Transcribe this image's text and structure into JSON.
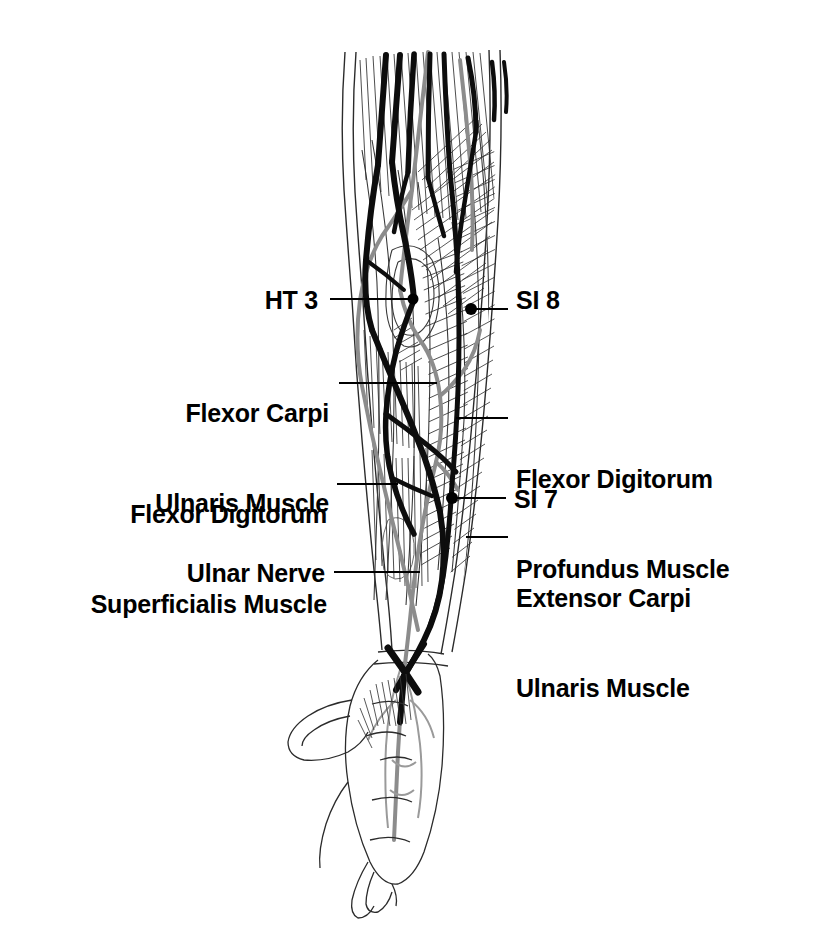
{
  "figure": {
    "view": "anterior-medial right forearm and hand",
    "colors": {
      "ink": "#1a1a1a",
      "vessel_gray": "#8c8c8c",
      "outline": "#3a3a3a",
      "background": "#ffffff",
      "leader": "#000000"
    }
  },
  "labels": [
    {
      "id": "ht3",
      "text": "HT 3",
      "side": "left",
      "lines": [
        "HT 3"
      ]
    },
    {
      "id": "si8",
      "text": "SI 8",
      "side": "right",
      "lines": [
        "SI 8"
      ]
    },
    {
      "id": "fcu",
      "text": "Flexor Carpi Ulnaris Muscle",
      "side": "left",
      "lines": [
        "Flexor Carpi",
        "Ulnaris Muscle"
      ]
    },
    {
      "id": "fds",
      "text": "Flexor Digitorum Superficialis Muscle",
      "side": "left",
      "lines": [
        "Flexor Digitorum",
        "Superficialis Muscle"
      ]
    },
    {
      "id": "fdp",
      "text": "Flexor Digitorum Profundus Muscle",
      "side": "right",
      "lines": [
        "Flexor Digitorum",
        "Profundus Muscle"
      ]
    },
    {
      "id": "si7",
      "text": "SI 7",
      "side": "right",
      "lines": [
        "SI 7"
      ]
    },
    {
      "id": "ecu",
      "text": "Extensor Carpi Ulnaris Muscle",
      "side": "right",
      "lines": [
        "Extensor Carpi",
        "Ulnaris Muscle"
      ]
    },
    {
      "id": "ulnar",
      "text": "Ulnar Nerve",
      "side": "left",
      "lines": [
        "Ulnar Nerve"
      ]
    }
  ],
  "acupoints": [
    {
      "name": "HT 3",
      "x": 413,
      "y": 299
    },
    {
      "name": "SI 8",
      "x": 471,
      "y": 309
    },
    {
      "name": "SI 7",
      "x": 452,
      "y": 498
    }
  ],
  "label_text": {
    "ht3": "HT 3",
    "si8": "SI 8",
    "si7": "SI 7",
    "fcu_1": "Flexor Carpi",
    "fcu_2": "Ulnaris Muscle",
    "fds_1": "Flexor Digitorum",
    "fds_2": "Superficialis Muscle",
    "fdp_1": "Flexor Digitorum",
    "fdp_2": "Profundus Muscle",
    "ecu_1": "Extensor Carpi",
    "ecu_2": "Ulnaris Muscle",
    "ulnar": "Ulnar Nerve"
  }
}
